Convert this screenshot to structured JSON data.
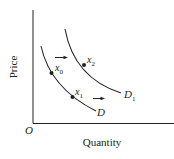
{
  "diagram": {
    "type": "demand-curve-shift",
    "axes": {
      "y_label": "Price",
      "x_label": "Quantity",
      "origin_label": "O"
    },
    "curves": [
      {
        "id": "D",
        "label": "D",
        "subscript": ""
      },
      {
        "id": "D1",
        "label": "D",
        "subscript": "1"
      }
    ],
    "points": [
      {
        "id": "x0",
        "label": "x",
        "subscript": "0",
        "curve": "D"
      },
      {
        "id": "x1",
        "label": "x",
        "subscript": "1",
        "curve": "D"
      },
      {
        "id": "x2",
        "label": "x",
        "subscript": "2",
        "curve": "D1"
      }
    ],
    "arrows": [
      {
        "id": "shift-arrow-upper",
        "direction": "right"
      },
      {
        "id": "shift-arrow-lower",
        "direction": "right"
      }
    ],
    "colors": {
      "ink": "#222222",
      "background": "#ffffff"
    }
  }
}
